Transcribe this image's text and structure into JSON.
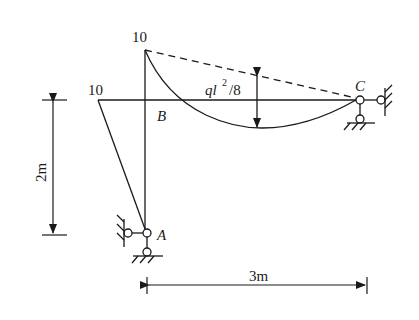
{
  "diagram": {
    "type": "structural-frame-moment-diagram",
    "labels": {
      "top_moment": "10",
      "left_moment": "10",
      "joint_b": "B",
      "joint_c": "C",
      "joint_a": "A",
      "midspan_moment_q": "ql",
      "midspan_moment_exp": "2",
      "midspan_moment_rest": "/8",
      "height_dim": "2m",
      "width_dim": "3m"
    },
    "colors": {
      "line": "#1a1a1a",
      "background": "#ffffff"
    }
  }
}
